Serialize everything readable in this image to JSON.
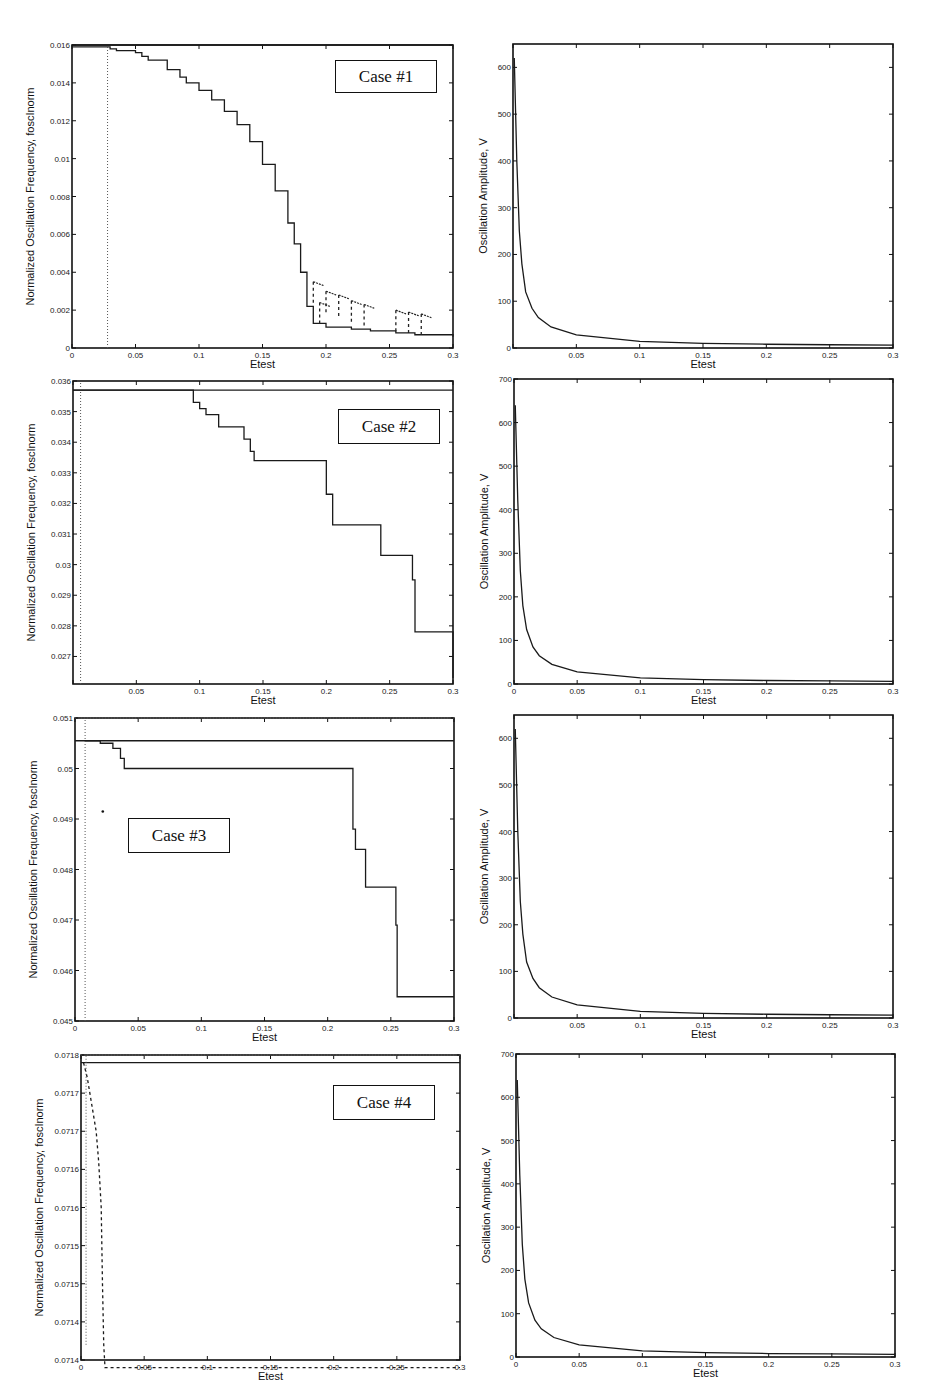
{
  "figure": {
    "panels": [
      {
        "id": "case1-freq",
        "case_label": "Case #1",
        "case_box": [
          335,
          60,
          102,
          33
        ]
      },
      {
        "id": "case1-amp"
      },
      {
        "id": "case2-freq",
        "case_label": "Case #2",
        "case_box": [
          338,
          409,
          102,
          35
        ]
      },
      {
        "id": "case2-amp"
      },
      {
        "id": "case3-freq",
        "case_label": "Case #3",
        "case_box": [
          128,
          818,
          102,
          35
        ]
      },
      {
        "id": "case3-amp"
      },
      {
        "id": "case4-freq",
        "case_label": "Case #4",
        "case_box": [
          333,
          1085,
          102,
          35
        ]
      },
      {
        "id": "case4-amp"
      }
    ]
  },
  "chart_data": [
    {
      "type": "line",
      "title": "Case #1 - Frequency",
      "case_label": "Case #1",
      "xlabel": "Etest",
      "ylabel": "Normalized Oscillation Frequency, foscInorm",
      "xlim": [
        0,
        0.3
      ],
      "ylim": [
        0,
        0.016
      ],
      "xticks": [
        "0",
        "0.05",
        "0.1",
        "0.15",
        "0.2",
        "0.25",
        "0.3"
      ],
      "yticks": [
        "0",
        "0.002",
        "0.004",
        "0.006",
        "0.008",
        "0.01",
        "0.012",
        "0.014",
        "0.016"
      ],
      "box": [
        72,
        45,
        381,
        303
      ],
      "series": [
        {
          "name": "upper bound",
          "style": "solid",
          "x": [
            0,
            0.3
          ],
          "y": [
            0.016,
            0.016
          ]
        },
        {
          "name": "foscInorm",
          "style": "stepped",
          "x": [
            0,
            0.03,
            0.035,
            0.045,
            0.05,
            0.055,
            0.06,
            0.065,
            0.075,
            0.085,
            0.09,
            0.1,
            0.11,
            0.12,
            0.13,
            0.14,
            0.15,
            0.16,
            0.17,
            0.175,
            0.18,
            0.185,
            0.19,
            0.2,
            0.22,
            0.235,
            0.255,
            0.27,
            0.285,
            0.3
          ],
          "y": [
            0.0159,
            0.0158,
            0.0157,
            0.0157,
            0.0156,
            0.0154,
            0.0152,
            0.0152,
            0.0147,
            0.0143,
            0.014,
            0.0136,
            0.0131,
            0.0125,
            0.0118,
            0.0109,
            0.0097,
            0.0083,
            0.0066,
            0.0055,
            0.004,
            0.0022,
            0.0013,
            0.0011,
            0.001,
            0.0009,
            0.0008,
            0.0007,
            0.0007,
            0.0006
          ]
        },
        {
          "name": "scatter branches",
          "style": "dashed",
          "x": [
            0.19,
            0.195,
            0.2,
            0.21,
            0.22,
            0.23,
            0.255,
            0.265,
            0.275
          ],
          "y": [
            0.0035,
            0.0024,
            0.003,
            0.0028,
            0.0025,
            0.0023,
            0.002,
            0.0019,
            0.0018
          ]
        },
        {
          "name": "initial vertical",
          "style": "dotted",
          "x": [
            0.028,
            0.028
          ],
          "y": [
            0,
            0.016
          ]
        }
      ]
    },
    {
      "type": "line",
      "title": "Case #1 - Amplitude",
      "xlabel": "Etest",
      "ylabel": "Oscillation Amplitude, V",
      "xlim": [
        0,
        0.3
      ],
      "ylim": [
        0,
        650
      ],
      "xticks": [
        "",
        "0.05",
        "0.1",
        "0.15",
        "0.2",
        "0.25",
        "0.3"
      ],
      "yticks": [
        "0",
        "100",
        "200",
        "300",
        "400",
        "500",
        "600"
      ],
      "box": [
        513,
        44,
        380,
        304
      ],
      "series": [
        {
          "name": "amplitude",
          "x": [
            0.001,
            0.003,
            0.005,
            0.007,
            0.01,
            0.015,
            0.02,
            0.03,
            0.05,
            0.1,
            0.15,
            0.2,
            0.25,
            0.3
          ],
          "y": [
            620,
            400,
            250,
            180,
            120,
            85,
            65,
            45,
            28,
            14,
            10,
            8,
            7,
            6
          ]
        }
      ]
    },
    {
      "type": "line",
      "title": "Case #2 - Frequency",
      "case_label": "Case #2",
      "xlabel": "Etest",
      "ylabel": "Normalized Oscillation Frequency, foscInorm",
      "xlim": [
        0,
        0.3
      ],
      "ylim": [
        0.0261,
        0.036
      ],
      "xticks": [
        "",
        "0.05",
        "0.1",
        "0.15",
        "0.2",
        "0.25",
        "0.3"
      ],
      "yticks": [
        "0.027",
        "0.028",
        "0.029",
        "0.03",
        "0.031",
        "0.032",
        "0.033",
        "0.034",
        "0.035",
        "0.036"
      ],
      "box": [
        73,
        381,
        380,
        303
      ],
      "series": [
        {
          "name": "upper bound",
          "style": "solid",
          "x": [
            0,
            0.3
          ],
          "y": [
            0.0357,
            0.0357
          ]
        },
        {
          "name": "foscInorm",
          "style": "stepped",
          "x": [
            0,
            0.09,
            0.095,
            0.1,
            0.105,
            0.115,
            0.135,
            0.14,
            0.143,
            0.197,
            0.2,
            0.205,
            0.24,
            0.243,
            0.268,
            0.27,
            0.287,
            0.3
          ],
          "y": [
            0.0357,
            0.0357,
            0.0353,
            0.0351,
            0.0349,
            0.0345,
            0.0341,
            0.0337,
            0.0334,
            0.0334,
            0.0323,
            0.0313,
            0.0313,
            0.0303,
            0.0295,
            0.0278,
            0.0278,
            0.0263
          ]
        },
        {
          "name": "initial vertical",
          "style": "dotted",
          "x": [
            0.006,
            0.006
          ],
          "y": [
            0.0261,
            0.036
          ]
        }
      ]
    },
    {
      "type": "line",
      "title": "Case #2 - Amplitude",
      "xlabel": "Etest",
      "ylabel": "Oscillation Amplitude, V",
      "xlim": [
        0,
        0.3
      ],
      "ylim": [
        0,
        700
      ],
      "xticks": [
        "0",
        "0.05",
        "0.1",
        "0.15",
        "0.2",
        "0.25",
        "0.3"
      ],
      "yticks": [
        "0",
        "100",
        "200",
        "300",
        "400",
        "500",
        "600",
        "700"
      ],
      "box": [
        514,
        379,
        379,
        305
      ],
      "series": [
        {
          "name": "amplitude",
          "x": [
            0.001,
            0.003,
            0.005,
            0.007,
            0.01,
            0.015,
            0.02,
            0.03,
            0.05,
            0.1,
            0.15,
            0.2,
            0.25,
            0.3
          ],
          "y": [
            640,
            420,
            260,
            180,
            125,
            85,
            65,
            45,
            28,
            14,
            10,
            8,
            7,
            6
          ]
        }
      ]
    },
    {
      "type": "line",
      "title": "Case #3 - Frequency",
      "case_label": "Case #3",
      "xlabel": "Etest",
      "ylabel": "Normalized Oscillation Frequency, foscInorm",
      "xlim": [
        0,
        0.3
      ],
      "ylim": [
        0.045,
        0.051
      ],
      "xticks": [
        "0",
        "0.05",
        "0.1",
        "0.15",
        "0.2",
        "0.25",
        "0.3"
      ],
      "yticks": [
        "0.045",
        "0.046",
        "0.047",
        "0.048",
        "0.049",
        "0.05",
        "0.051"
      ],
      "box": [
        75,
        718,
        379,
        303
      ],
      "series": [
        {
          "name": "upper bound",
          "style": "dotted",
          "x": [
            0,
            0.3
          ],
          "y": [
            0.051,
            0.051
          ]
        },
        {
          "name": "reference",
          "style": "solid",
          "x": [
            0,
            0.3
          ],
          "y": [
            0.05055,
            0.05055
          ]
        },
        {
          "name": "foscInorm",
          "style": "stepped",
          "x": [
            0.008,
            0.02,
            0.03,
            0.036,
            0.039,
            0.04,
            0.218,
            0.22,
            0.222,
            0.224,
            0.23,
            0.251,
            0.254,
            0.255,
            0.3
          ],
          "y": [
            0.05055,
            0.0505,
            0.0504,
            0.0502,
            0.05,
            0.05,
            0.05,
            0.0488,
            0.0484,
            0.0484,
            0.04765,
            0.04765,
            0.0469,
            0.04548,
            0.04548
          ]
        },
        {
          "name": "outlier",
          "style": "point",
          "x": [
            0.022
          ],
          "y": [
            0.04915
          ]
        },
        {
          "name": "initial vertical",
          "style": "dotted",
          "x": [
            0.008,
            0.008
          ],
          "y": [
            0.045,
            0.051
          ]
        }
      ]
    },
    {
      "type": "line",
      "title": "Case #3 - Amplitude",
      "xlabel": "Etest",
      "ylabel": "Oscillation Amplitude, V",
      "xlim": [
        0,
        0.3
      ],
      "ylim": [
        0,
        650
      ],
      "xticks": [
        "",
        "0.05",
        "0.1",
        "0.15",
        "0.2",
        "0.25",
        "0.3"
      ],
      "yticks": [
        "0",
        "100",
        "200",
        "300",
        "400",
        "500",
        "600"
      ],
      "box": [
        514,
        715,
        379,
        303
      ],
      "series": [
        {
          "name": "amplitude",
          "x": [
            0.001,
            0.003,
            0.005,
            0.007,
            0.01,
            0.015,
            0.02,
            0.03,
            0.05,
            0.1,
            0.15,
            0.2,
            0.25,
            0.3
          ],
          "y": [
            620,
            400,
            250,
            180,
            120,
            85,
            65,
            45,
            28,
            14,
            10,
            8,
            7,
            6
          ]
        }
      ]
    },
    {
      "type": "line",
      "title": "Case #4 - Frequency",
      "case_label": "Case #4",
      "xlabel": "Etest",
      "ylabel": "Normalized Oscillation Frequency, foscInorm",
      "xlim": [
        0,
        0.3
      ],
      "ylim": [
        0.0714,
        0.0718
      ],
      "xticks": [
        "0",
        "0.05",
        "0.1",
        "0.15",
        "0.2",
        "0.25",
        "0.3"
      ],
      "yticks": [
        "0.0714",
        "0.0714",
        "0.0715",
        "0.0715",
        "0.0716",
        "0.0716",
        "0.0717",
        "0.0717",
        "0.0718"
      ],
      "box": [
        81,
        1055,
        379,
        305
      ],
      "series": [
        {
          "name": "upper bound",
          "style": "dotted",
          "x": [
            0,
            0.3
          ],
          "y": [
            0.0718,
            0.0718
          ]
        },
        {
          "name": "reference",
          "style": "solid",
          "x": [
            0,
            0.3
          ],
          "y": [
            0.07179,
            0.07179
          ]
        },
        {
          "name": "foscInorm",
          "style": "dashed",
          "x": [
            0.002,
            0.005,
            0.008,
            0.012,
            0.014,
            0.016,
            0.017,
            0.018,
            0.019,
            0.3
          ],
          "y": [
            0.07179,
            0.07177,
            0.07174,
            0.0717,
            0.07166,
            0.0716,
            0.0715,
            0.07142,
            0.07139,
            0.07139
          ]
        },
        {
          "name": "initial vertical",
          "style": "dotted",
          "x": [
            0.004,
            0.004
          ],
          "y": [
            0.07142,
            0.0718
          ]
        }
      ]
    },
    {
      "type": "line",
      "title": "Case #4 - Amplitude",
      "xlabel": "Etest",
      "ylabel": "Oscillation Amplitude, V",
      "xlim": [
        0,
        0.3
      ],
      "ylim": [
        0,
        700
      ],
      "xticks": [
        "0",
        "0.05",
        "0.1",
        "0.15",
        "0.2",
        "0.25",
        "0.3"
      ],
      "yticks": [
        "0",
        "100",
        "200",
        "300",
        "400",
        "500",
        "600",
        "700"
      ],
      "box": [
        516,
        1054,
        379,
        303
      ],
      "series": [
        {
          "name": "amplitude",
          "x": [
            0.001,
            0.003,
            0.005,
            0.007,
            0.01,
            0.015,
            0.02,
            0.03,
            0.05,
            0.1,
            0.15,
            0.2,
            0.25,
            0.3
          ],
          "y": [
            640,
            420,
            260,
            180,
            125,
            85,
            65,
            45,
            28,
            14,
            10,
            8,
            7,
            6
          ]
        }
      ]
    }
  ]
}
